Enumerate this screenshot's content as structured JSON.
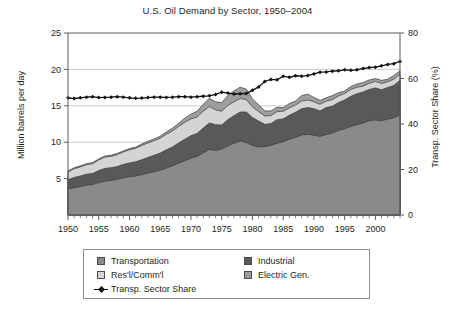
{
  "chart_data": {
    "type": "area",
    "title": "U.S. Oil Demand by Sector, 1950–2004",
    "xlabel": "",
    "ylabel": "Million barrels per day",
    "y2label": "Transp. Sector Share (%)",
    "xlim": [
      1950,
      2004
    ],
    "ylim": [
      0,
      25
    ],
    "y2lim": [
      0,
      80
    ],
    "grid": true,
    "legend_position": "below-center",
    "stacked": true,
    "x": [
      1950,
      1951,
      1952,
      1953,
      1954,
      1955,
      1956,
      1957,
      1958,
      1959,
      1960,
      1961,
      1962,
      1963,
      1964,
      1965,
      1966,
      1967,
      1968,
      1969,
      1970,
      1971,
      1972,
      1973,
      1974,
      1975,
      1976,
      1977,
      1978,
      1979,
      1980,
      1981,
      1982,
      1983,
      1984,
      1985,
      1986,
      1987,
      1988,
      1989,
      1990,
      1991,
      1992,
      1993,
      1994,
      1995,
      1996,
      1997,
      1998,
      1999,
      2000,
      2001,
      2002,
      2003,
      2004
    ],
    "x_ticks": [
      1950,
      1955,
      1960,
      1965,
      1970,
      1975,
      1980,
      1985,
      1990,
      1995,
      2000
    ],
    "y_ticks": [
      5,
      10,
      15,
      20,
      25
    ],
    "y2_ticks": [
      0,
      20,
      40,
      60,
      80
    ],
    "series": [
      {
        "name": "Transportation",
        "color": "#8a8a8a",
        "values": [
          3.55,
          3.75,
          3.9,
          4.1,
          4.2,
          4.45,
          4.65,
          4.75,
          4.9,
          5.1,
          5.25,
          5.35,
          5.55,
          5.75,
          5.95,
          6.15,
          6.45,
          6.75,
          7.1,
          7.45,
          7.8,
          8.05,
          8.55,
          9.0,
          8.85,
          9.05,
          9.5,
          9.85,
          10.15,
          9.95,
          9.55,
          9.35,
          9.4,
          9.55,
          9.85,
          10.05,
          10.4,
          10.65,
          11.0,
          11.1,
          10.95,
          10.8,
          11.05,
          11.25,
          11.6,
          11.85,
          12.15,
          12.4,
          12.65,
          12.95,
          13.05,
          12.95,
          13.15,
          13.35,
          13.75
        ]
      },
      {
        "name": "Industrial",
        "color": "#595959",
        "values": [
          1.3,
          1.4,
          1.45,
          1.5,
          1.5,
          1.65,
          1.75,
          1.75,
          1.75,
          1.85,
          1.9,
          1.95,
          2.05,
          2.15,
          2.25,
          2.35,
          2.5,
          2.6,
          2.8,
          2.95,
          3.1,
          3.15,
          3.4,
          3.65,
          3.55,
          3.3,
          3.6,
          3.8,
          4.0,
          4.2,
          3.85,
          3.55,
          3.05,
          3.0,
          3.25,
          3.15,
          3.3,
          3.45,
          3.6,
          3.65,
          3.65,
          3.5,
          3.7,
          3.7,
          3.85,
          3.95,
          4.15,
          4.25,
          4.25,
          4.3,
          4.4,
          4.25,
          4.35,
          4.45,
          4.75
        ]
      },
      {
        "name": "Res'l/Comm'l",
        "color": "#d4d4d4",
        "values": [
          1.05,
          1.2,
          1.25,
          1.3,
          1.35,
          1.45,
          1.55,
          1.55,
          1.65,
          1.7,
          1.8,
          1.85,
          1.95,
          2.0,
          2.0,
          2.05,
          2.15,
          2.2,
          2.25,
          2.35,
          2.3,
          2.25,
          2.3,
          2.25,
          2.05,
          1.9,
          1.95,
          1.9,
          1.85,
          1.7,
          1.45,
          1.3,
          1.15,
          1.1,
          1.1,
          1.05,
          1.0,
          1.0,
          1.05,
          1.05,
          0.95,
          0.9,
          0.9,
          0.9,
          0.9,
          0.9,
          0.95,
          0.9,
          0.8,
          0.85,
          0.9,
          0.85,
          0.8,
          0.85,
          0.85
        ]
      },
      {
        "name": "Electric Gen.",
        "color": "#9e9e9e",
        "values": [
          0.15,
          0.15,
          0.15,
          0.15,
          0.15,
          0.15,
          0.15,
          0.15,
          0.15,
          0.15,
          0.18,
          0.18,
          0.2,
          0.22,
          0.25,
          0.28,
          0.32,
          0.38,
          0.45,
          0.55,
          0.65,
          0.8,
          0.95,
          1.15,
          1.1,
          1.2,
          1.35,
          1.5,
          1.55,
          1.45,
          1.1,
          0.95,
          0.7,
          0.65,
          0.6,
          0.5,
          0.6,
          0.55,
          0.75,
          0.8,
          0.6,
          0.55,
          0.45,
          0.55,
          0.45,
          0.35,
          0.4,
          0.45,
          0.5,
          0.45,
          0.4,
          0.45,
          0.35,
          0.5,
          0.45
        ]
      }
    ],
    "line_series": {
      "name": "Transp. Sector Share",
      "color": "#111111",
      "axis": "right",
      "unit": "%",
      "values": [
        51.5,
        51.2,
        51.5,
        51.8,
        52.0,
        51.6,
        51.7,
        51.8,
        52.0,
        51.8,
        51.5,
        51.3,
        51.4,
        51.6,
        51.8,
        51.8,
        51.7,
        51.8,
        52.0,
        52.0,
        51.8,
        52.0,
        52.2,
        52.4,
        53.0,
        54.0,
        53.6,
        53.2,
        53.3,
        53.4,
        54.8,
        56.3,
        58.7,
        59.6,
        59.4,
        61.0,
        60.5,
        61.2,
        61.0,
        61.3,
        62.0,
        62.8,
        62.9,
        63.2,
        63.4,
        63.8,
        63.6,
        63.8,
        64.4,
        64.8,
        65.0,
        65.6,
        66.2,
        66.5,
        67.5
      ]
    }
  },
  "legend": {
    "items": [
      {
        "label": "Transportation",
        "marker": "swatch"
      },
      {
        "label": "Industrial",
        "marker": "swatch"
      },
      {
        "label": "Res'l/Comm'l",
        "marker": "swatch"
      },
      {
        "label": "Electric Gen.",
        "marker": "swatch"
      },
      {
        "label": "Transp. Sector Share",
        "marker": "line-diamond"
      }
    ]
  },
  "colors": {
    "transportation": "#8a8a8a",
    "industrial": "#595959",
    "residential_commercial": "#d4d4d4",
    "electric_gen": "#9e9e9e",
    "line": "#111111",
    "axis": "#5a5a5a",
    "grid": "#bfbfbf",
    "background": "#ffffff"
  }
}
